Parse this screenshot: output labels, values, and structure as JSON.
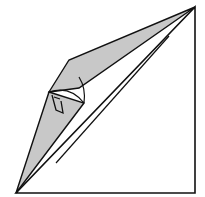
{
  "diagram": {
    "type": "origami-step",
    "colors": {
      "paper_back": "#ffffff",
      "paper_colored": "#c8c8c8",
      "line": "#111111"
    },
    "shapes": {
      "base_triangle": "195,7 195,193 16,193",
      "upper_flap": "195,7 69,60 49,92 79,88",
      "lower_flap": "49,92 84,103 16,193",
      "fold_line": "56,163 169,36"
    }
  }
}
